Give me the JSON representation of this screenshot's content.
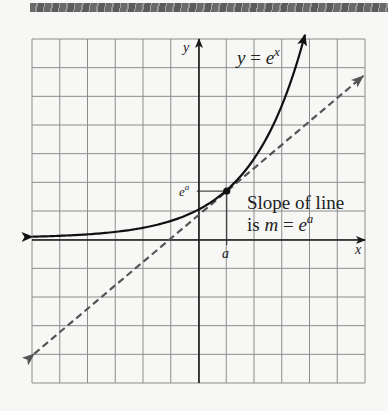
{
  "chart_data": {
    "type": "line",
    "title": "",
    "xlabel": "x",
    "ylabel": "y",
    "grid": true,
    "xlim": [
      -6,
      6
    ],
    "ylim": [
      -5,
      7
    ],
    "series": [
      {
        "name": "y = e^x",
        "style": "solid",
        "function": "exponential",
        "base_display": "e",
        "points": [
          [
            -6,
            0.05
          ],
          [
            -4,
            0.13
          ],
          [
            -2,
            0.36
          ],
          [
            -1,
            0.6
          ],
          [
            0,
            1.0
          ],
          [
            1,
            1.67
          ],
          [
            2,
            2.79
          ],
          [
            3,
            4.65
          ],
          [
            3.82,
            7.0
          ]
        ]
      },
      {
        "name": "tangent line at x = a",
        "style": "dashed",
        "slope_label": "m = e^a",
        "points": [
          [
            -5.94,
            -3.97
          ],
          [
            5.92,
            5.72
          ]
        ]
      }
    ],
    "point_of_tangency": {
      "x_label": "a",
      "y_label": "e^a",
      "x": 1,
      "y": 1.67
    },
    "annotations": [
      {
        "text": "y = e^x",
        "near": "curve top"
      },
      {
        "text": "Slope of line",
        "line": 1
      },
      {
        "text": "is m = e^a",
        "line": 2
      }
    ]
  },
  "labels": {
    "y_axis": "y",
    "x_axis": "x",
    "curve_y": "y",
    "curve_eq": " = ",
    "curve_e": "e",
    "curve_exp": "x",
    "point_y_base": "e",
    "point_y_exp": "a",
    "point_x": "a",
    "slope_line1": "Slope of line",
    "slope_is": "is ",
    "slope_m": "m",
    "slope_eq": " = ",
    "slope_e": "e",
    "slope_exp": "a"
  },
  "layout": {
    "grid_left": 32,
    "grid_top": 39,
    "grid_right": 365,
    "grid_bottom": 383,
    "cols": 12,
    "rows": 12,
    "origin_px": [
      199,
      240
    ],
    "unit_x": 27.75,
    "unit_y": 28.67,
    "curve_base": 1.67,
    "curve_x_start": -6.0,
    "curve_x_end": 3.82,
    "colors": {
      "grid": "#8c8c8c",
      "axis": "#1a1a1a",
      "curve": "#111111",
      "tangent": "#555555",
      "paper": "#f7f7f5"
    }
  }
}
